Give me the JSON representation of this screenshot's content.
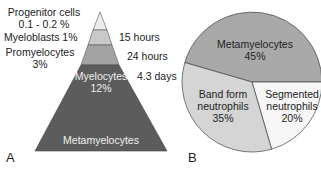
{
  "panel_a": {
    "letter": "A",
    "left_labels": {
      "progenitor_line1": "Progenitor cells",
      "progenitor_line2": "0.1 - 0.2 %",
      "myeloblasts": "Myeloblasts 1%",
      "promyelocytes_line1": "Promyelocytes",
      "promyelocytes_line2": "3%"
    },
    "right_labels": {
      "t1": "15 hours",
      "t2": "24 hours",
      "t3": "4.3 days"
    },
    "inner_labels": {
      "myelocytes_line1": "Myelocytes",
      "myelocytes_line2": "12%",
      "metamyelocytes": "Metamyelocytes"
    },
    "layers": [
      {
        "name": "Progenitor cells",
        "value": "0.1 - 0.2 %",
        "color": "#ececec"
      },
      {
        "name": "Myeloblasts",
        "value": "1%",
        "time": "15 hours",
        "color": "#c9c9c9"
      },
      {
        "name": "Promyelocytes",
        "value": "3%",
        "time": "24 hours",
        "color": "#a3a3a3"
      },
      {
        "name": "Myelocytes",
        "value": "12%",
        "time": "4.3 days",
        "color": "#5c5c5c"
      },
      {
        "name": "Metamyelocytes",
        "color": "#5c5c5c"
      }
    ]
  },
  "panel_b": {
    "letter": "B",
    "slices": [
      {
        "name": "Metamyelocytes",
        "line1": "Metamyelocytes",
        "pct": "45%",
        "value": 45,
        "color": "#a9a9a9"
      },
      {
        "name": "Band form neutrophils",
        "line1": "Band form",
        "line2": "neutrophils",
        "pct": "35%",
        "value": 35,
        "color": "#d5d5d5"
      },
      {
        "name": "Segmented neutrophils",
        "line1": "Segmented",
        "line2": "neutrophils",
        "pct": "20%",
        "value": 20,
        "color": "#f6f6f6"
      }
    ]
  }
}
